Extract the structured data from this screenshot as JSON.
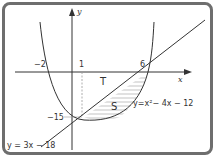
{
  "diagram": {
    "axes": {
      "x_label": "x",
      "y_label": "y"
    },
    "tick_labels": {
      "x_neg2": "−2",
      "x_1": "1",
      "x_6": "6",
      "y_neg15": "−15"
    },
    "regions": {
      "T": "T",
      "S": "S"
    },
    "curves": {
      "parabola_label": "y=x²− 4x − 12",
      "line_label": "y = 3x − 18"
    },
    "colors": {
      "frame": "#6e6e6e",
      "lines": "#333333",
      "hatch": "#9a9a9a",
      "dashed": "#9a9a9a"
    }
  }
}
